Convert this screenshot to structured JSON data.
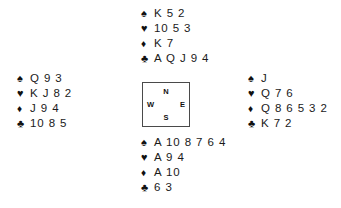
{
  "diagram": {
    "type": "bridge-deal",
    "suit_glyphs": {
      "spade": "♠",
      "heart": "♥",
      "diamond": "♦",
      "club": "♣"
    },
    "compass": {
      "north": "N",
      "west": "W",
      "east": "E",
      "south": "S"
    },
    "hands": {
      "north": {
        "position_label": "North",
        "suits": [
          {
            "suit": "spade",
            "glyph": "♠",
            "cards": "K 5 2"
          },
          {
            "suit": "heart",
            "glyph": "♥",
            "cards": "10 5 3"
          },
          {
            "suit": "diamond",
            "glyph": "♦",
            "cards": "K 7"
          },
          {
            "suit": "club",
            "glyph": "♣",
            "cards": "A Q J 9 4"
          }
        ]
      },
      "west": {
        "position_label": "West",
        "suits": [
          {
            "suit": "spade",
            "glyph": "♠",
            "cards": "Q 9 3"
          },
          {
            "suit": "heart",
            "glyph": "♥",
            "cards": "K J 8 2"
          },
          {
            "suit": "diamond",
            "glyph": "♦",
            "cards": "J 9 4"
          },
          {
            "suit": "club",
            "glyph": "♣",
            "cards": "10 8 5"
          }
        ]
      },
      "east": {
        "position_label": "East",
        "suits": [
          {
            "suit": "spade",
            "glyph": "♠",
            "cards": "J"
          },
          {
            "suit": "heart",
            "glyph": "♥",
            "cards": "Q 7 6"
          },
          {
            "suit": "diamond",
            "glyph": "♦",
            "cards": "Q 8 6 5 3 2"
          },
          {
            "suit": "club",
            "glyph": "♣",
            "cards": "K 7 2"
          }
        ]
      },
      "south": {
        "position_label": "South",
        "suits": [
          {
            "suit": "spade",
            "glyph": "♠",
            "cards": "A 10 8 7 6 4"
          },
          {
            "suit": "heart",
            "glyph": "♥",
            "cards": "A 9 4"
          },
          {
            "suit": "diamond",
            "glyph": "♦",
            "cards": "A 10"
          },
          {
            "suit": "club",
            "glyph": "♣",
            "cards": "6 3"
          }
        ]
      }
    },
    "colors": {
      "background": "#ffffff",
      "text": "#1a1a1a",
      "symbol": "#111111",
      "box_border": "#4a4a4a"
    }
  }
}
